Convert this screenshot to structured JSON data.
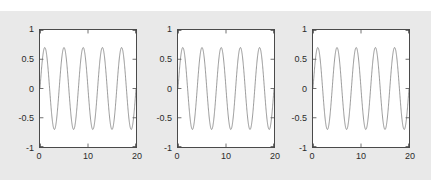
{
  "figure": {
    "background_color": "#e9e9e9",
    "axes_background_color": "#ffffff",
    "axes_border_color": "#4a4a4a",
    "line_color": "#6b6b6b",
    "tick_label_color": "#2b2b2b"
  },
  "chart_data": [
    {
      "type": "line",
      "title": "",
      "xlabel": "",
      "ylabel": "",
      "xlim": [
        0,
        20
      ],
      "ylim": [
        -1,
        1
      ],
      "xticks": [
        0,
        10,
        20
      ],
      "xtick_labels": [
        "0",
        "10",
        "20"
      ],
      "yticks": [
        -1,
        -0.5,
        0,
        0.5,
        1
      ],
      "ytick_labels": [
        "-1",
        "-0.5",
        "0",
        "0.5",
        "1"
      ],
      "grid": false,
      "legend": null,
      "series": [
        {
          "name": "signal",
          "description": "sinusoid, amplitude 0.7, about 5 cycles over x = 0 to 20",
          "amplitude": 0.7,
          "cycles": 5,
          "phase": 0,
          "color": "#6b6b6b"
        }
      ]
    },
    {
      "type": "line",
      "title": "",
      "xlabel": "",
      "ylabel": "",
      "xlim": [
        0,
        20
      ],
      "ylim": [
        -1,
        1
      ],
      "xticks": [
        0,
        10,
        20
      ],
      "xtick_labels": [
        "0",
        "10",
        "20"
      ],
      "yticks": [
        -1,
        -0.5,
        0,
        0.5,
        1
      ],
      "ytick_labels": [
        "-1",
        "-0.5",
        "0",
        "0.5",
        "1"
      ],
      "grid": false,
      "legend": null,
      "series": [
        {
          "name": "signal",
          "description": "sinusoid, amplitude 0.7, about 5 cycles over x = 0 to 20",
          "amplitude": 0.7,
          "cycles": 5,
          "phase": 0,
          "color": "#6b6b6b"
        }
      ]
    },
    {
      "type": "line",
      "title": "",
      "xlabel": "",
      "ylabel": "",
      "xlim": [
        0,
        20
      ],
      "ylim": [
        -1,
        1
      ],
      "xticks": [
        0,
        10,
        20
      ],
      "xtick_labels": [
        "0",
        "10",
        "20"
      ],
      "yticks": [
        -1,
        -0.5,
        0,
        0.5,
        1
      ],
      "ytick_labels": [
        "-1",
        "-0.5",
        "0",
        "0.5",
        "1"
      ],
      "grid": false,
      "legend": null,
      "series": [
        {
          "name": "signal",
          "description": "sinusoid, amplitude 0.7, about 5 cycles over x = 0 to 20",
          "amplitude": 0.7,
          "cycles": 5,
          "phase": 0,
          "color": "#6b6b6b"
        }
      ]
    }
  ]
}
